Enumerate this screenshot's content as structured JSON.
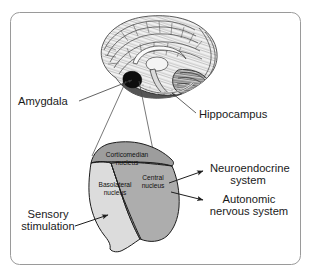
{
  "figure": {
    "background_color": "#ffffff",
    "border_color": "#9a9a9a"
  },
  "brain": {
    "name": "brain-sagittal-illustration",
    "view": "medial sagittal section",
    "highlight_region": "amygdala",
    "highlight_color": "#111111"
  },
  "callout_labels": [
    {
      "id": "amygdala",
      "text": "Amygdala"
    },
    {
      "id": "hippocampus",
      "text": "Hippocampus"
    }
  ],
  "amygdala_nuclei": [
    {
      "id": "corticomedian",
      "line1": "Corticomedian",
      "line2": "nucleus",
      "fill": "#9d9d9d"
    },
    {
      "id": "basolateral",
      "line1": "Basolateral",
      "line2": "nucleus",
      "fill": "#dcdcdc"
    },
    {
      "id": "central",
      "line1": "Central",
      "line2": "nucleus",
      "fill": "#adadad"
    }
  ],
  "input_label": {
    "id": "sensory-stimulation",
    "line1": "Sensory",
    "line2": "stimulation"
  },
  "output_labels": [
    {
      "id": "neuroendocrine-system",
      "line1": "Neuroendocrine",
      "line2": "system"
    },
    {
      "id": "autonomic-nervous-system",
      "line1": "Autonomic",
      "line2": "nervous system"
    }
  ]
}
